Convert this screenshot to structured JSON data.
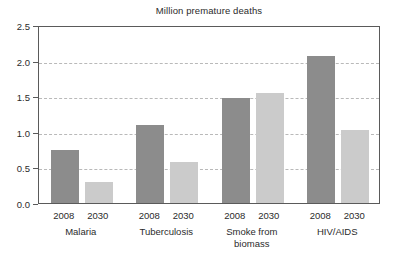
{
  "chart_data": {
    "type": "bar",
    "title": "Million premature deaths",
    "xlabel": "",
    "ylabel": "",
    "ylim": [
      0.0,
      2.5
    ],
    "yticks": [
      "0.0",
      "0.5",
      "1.0",
      "1.5",
      "2.0",
      "2.5"
    ],
    "ytick_values": [
      0.0,
      0.5,
      1.0,
      1.5,
      2.0,
      2.5
    ],
    "grid": "horizontal-dashed",
    "legend": "none",
    "categories": [
      "Malaria",
      "Tuberculosis",
      "Smoke from biomass",
      "HIV/AIDS"
    ],
    "category_lines": [
      [
        "Malaria"
      ],
      [
        "Tuberculosis"
      ],
      [
        "Smoke from",
        "biomass"
      ],
      [
        "HIV/AIDS"
      ]
    ],
    "series": [
      {
        "name": "2008",
        "values": [
          0.74,
          1.1,
          1.47,
          2.07
        ],
        "color": "#8c8c8c"
      },
      {
        "name": "2030",
        "values": [
          0.3,
          0.57,
          1.55,
          1.03
        ],
        "color": "#cbcbcb"
      }
    ],
    "bars": [
      {
        "group": "Malaria",
        "series": "2008",
        "value": 0.74
      },
      {
        "group": "Malaria",
        "series": "2030",
        "value": 0.3
      },
      {
        "group": "Tuberculosis",
        "series": "2008",
        "value": 1.1
      },
      {
        "group": "Tuberculosis",
        "series": "2030",
        "value": 0.57
      },
      {
        "group": "Smoke from biomass",
        "series": "2008",
        "value": 1.47
      },
      {
        "group": "Smoke from biomass",
        "series": "2030",
        "value": 1.55
      },
      {
        "group": "HIV/AIDS",
        "series": "2008",
        "value": 2.07
      },
      {
        "group": "HIV/AIDS",
        "series": "2030",
        "value": 1.03
      }
    ],
    "colors": {
      "series_2008": "#8c8c8c",
      "series_2030": "#cbcbcb",
      "axis": "#5a5a5a",
      "grid": "#b9b9b9",
      "text": "#2b2b2b",
      "background": "#ffffff"
    }
  }
}
